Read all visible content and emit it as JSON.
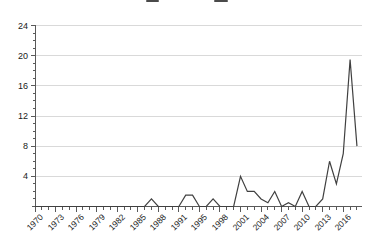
{
  "header": {
    "title_cropped": true
  },
  "chart_data": {
    "type": "line",
    "title": "",
    "xlabel": "",
    "ylabel": "",
    "categories": [
      "1970",
      "1971",
      "1972",
      "1973",
      "1974",
      "1975",
      "1976",
      "1977",
      "1978",
      "1979",
      "1980",
      "1981",
      "1982",
      "1983",
      "1984",
      "1985",
      "1986",
      "1987",
      "1988",
      "1989",
      "1990",
      "1991",
      "1992",
      "1994",
      "1995",
      "1996",
      "1997",
      "1998",
      "1999",
      "2000",
      "2001",
      "2002",
      "2003",
      "2004",
      "2005",
      "2006",
      "2007",
      "2008",
      "2009",
      "2010",
      "2011",
      "2012",
      "2013",
      "2014",
      "2015",
      "2016",
      "2017",
      "2018"
    ],
    "values": [
      0,
      0,
      0,
      0,
      0,
      0,
      0,
      0,
      0,
      0,
      0,
      0,
      0,
      0,
      0,
      0,
      0,
      1,
      0,
      0,
      0,
      0,
      1.5,
      1.5,
      0,
      0,
      1,
      0,
      0,
      0,
      4,
      2,
      2,
      1,
      0.5,
      2,
      0,
      0.5,
      0,
      2,
      0,
      0,
      1,
      6,
      3,
      7,
      19.5,
      8
    ],
    "x_tick_labels": [
      "1970",
      "1973",
      "1976",
      "1979",
      "1982",
      "1985",
      "1988",
      "1991",
      "1995",
      "1998",
      "2001",
      "2004",
      "2007",
      "2010",
      "2013",
      "2016"
    ],
    "x_major_tick_every": 3,
    "y_major_ticks": [
      4,
      8,
      12,
      16,
      20,
      24
    ],
    "y_minor_tick_step": 1,
    "ylim": [
      0,
      24
    ],
    "grid": "horizontal-major",
    "legend": "none",
    "colors": {
      "line": "#404040",
      "grid": "#d9d9d9",
      "axis": "#595959",
      "labels": "#1a1a1a",
      "background": "#ffffff"
    }
  }
}
